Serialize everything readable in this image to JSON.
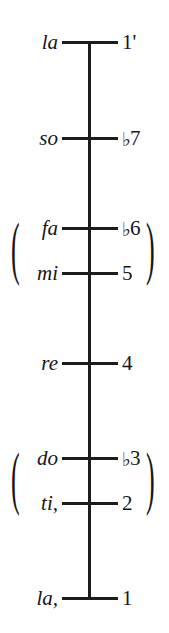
{
  "chart_data": {
    "type": "table",
    "title": "",
    "subtitle": "",
    "xlabel": "",
    "ylabel": "",
    "orientation": "vertical-axis",
    "axis": {
      "top_y": 42,
      "bottom_y": 598,
      "color": "#1c1c1c"
    },
    "grid": false,
    "legend": null,
    "notes": [
      {
        "syllable": "la",
        "degree": "1'",
        "degree_accidental": "",
        "degree_number": "1",
        "octave_mark": "'",
        "y": 42,
        "grouped": false
      },
      {
        "syllable": "so",
        "degree": "♭7",
        "degree_accidental": "♭",
        "degree_number": "7",
        "octave_mark": "",
        "y": 138,
        "grouped": false
      },
      {
        "syllable": "fa",
        "degree": "♭6",
        "degree_accidental": "♭",
        "degree_number": "6",
        "octave_mark": "",
        "y": 228,
        "grouped": true,
        "group": "upper-pair"
      },
      {
        "syllable": "mi",
        "degree": "5",
        "degree_accidental": "",
        "degree_number": "5",
        "octave_mark": "",
        "y": 273,
        "grouped": true,
        "group": "upper-pair"
      },
      {
        "syllable": "re",
        "degree": "4",
        "degree_accidental": "",
        "degree_number": "4",
        "octave_mark": "",
        "y": 363,
        "grouped": false
      },
      {
        "syllable": "do",
        "degree": "♭3",
        "degree_accidental": "♭",
        "degree_number": "3",
        "octave_mark": "",
        "y": 458,
        "grouped": true,
        "group": "lower-pair"
      },
      {
        "syllable": "ti,",
        "degree": "2",
        "degree_accidental": "",
        "degree_number": "2",
        "octave_mark": ",",
        "y": 503,
        "grouped": true,
        "group": "lower-pair"
      },
      {
        "syllable": "la,",
        "degree": "1",
        "degree_accidental": "",
        "degree_number": "1",
        "octave_mark": ",",
        "y": 598,
        "grouped": false
      }
    ],
    "groups": [
      {
        "id": "upper-pair",
        "open_paren": "(",
        "close_paren": ")",
        "center_y": 250,
        "members": [
          "fa",
          "mi"
        ]
      },
      {
        "id": "lower-pair",
        "open_paren": "(",
        "close_paren": ")",
        "center_y": 480,
        "members": [
          "do",
          "ti,"
        ]
      }
    ],
    "colors": {
      "ink": "#16161a",
      "line": "#1c1c1c",
      "background": "#ffffff"
    }
  }
}
